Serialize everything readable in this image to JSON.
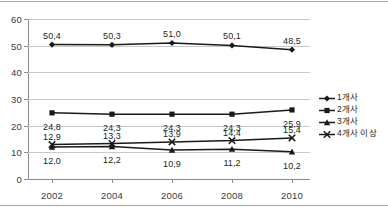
{
  "chart_data": {
    "type": "line",
    "title": "",
    "xlabel": "",
    "ylabel": "",
    "categories": [
      "2002",
      "2004",
      "2006",
      "2008",
      "2010"
    ],
    "ylim": [
      0,
      60
    ],
    "yticks": [
      "0",
      "10",
      "20",
      "30",
      "40",
      "50",
      "60"
    ],
    "grid": true,
    "legend_position": "right",
    "series": [
      {
        "name": "1개사",
        "marker": "diamond",
        "color": "#1a1a1a",
        "values": [
          50.4,
          50.3,
          51.0,
          50.1,
          48.5
        ],
        "labels": [
          "50,4",
          "50,3",
          "51,0",
          "50,1",
          "48,5"
        ]
      },
      {
        "name": "2개사",
        "marker": "square",
        "color": "#1a1a1a",
        "values": [
          24.8,
          24.3,
          24.3,
          24.3,
          25.9
        ],
        "labels": [
          "24,8",
          "24,3",
          "24,3",
          "24,3",
          "25,9"
        ]
      },
      {
        "name": "3개사",
        "marker": "triangle",
        "color": "#1a1a1a",
        "values": [
          12.0,
          12.2,
          10.9,
          11.2,
          10.2
        ],
        "labels": [
          "12,0",
          "12,2",
          "10,9",
          "11,2",
          "10,2"
        ]
      },
      {
        "name": "4개사 이상",
        "marker": "cross",
        "color": "#1a1a1a",
        "values": [
          12.9,
          13.3,
          13.9,
          14.4,
          15.4
        ],
        "labels": [
          "12,9",
          "13,3",
          "13,9",
          "14,4",
          "15,4"
        ]
      }
    ]
  }
}
